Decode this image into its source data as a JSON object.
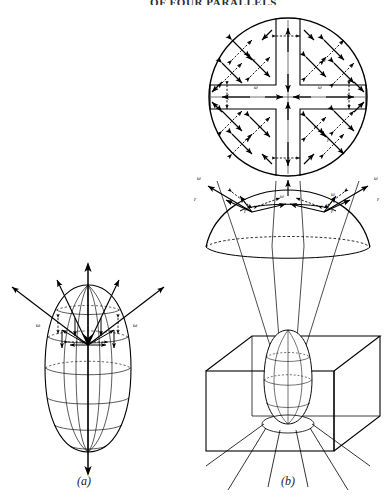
{
  "figure": {
    "domain": "scientific-illustration",
    "header_fragment": "OF FOUR PARALLELS",
    "background_color": "#ffffff",
    "ink_color": "#000000",
    "panels": [
      {
        "id": "a",
        "caption": "(a)",
        "description": "Ovoid (egg-shaped) body with meridian and parallel grid lines, a vertical axis arrow through the poles, and arrows radiating outward from the upper region.",
        "labels": [
          "ω",
          "ω"
        ]
      },
      {
        "id": "b",
        "caption": "(b)",
        "description": "Three-level construction: top-down circular disk with cross-shaped inner region and radiating arrow pairs; mid-level dome with arrows; lower 3D box containing a small ovoid with projection rays.",
        "labels": [
          "ω",
          "ε"
        ]
      }
    ],
    "symbols": {
      "omega": "ω",
      "epsilon": "ε"
    },
    "disk_labels": [
      {
        "symbol": "ε",
        "x": 253,
        "y": 62
      },
      {
        "symbol": "ε",
        "x": 324,
        "y": 62
      },
      {
        "symbol": "ω",
        "x": 254,
        "y": 89
      },
      {
        "symbol": "ω",
        "x": 321,
        "y": 89
      },
      {
        "symbol": "ω",
        "x": 258,
        "y": 127
      },
      {
        "symbol": "ω",
        "x": 316,
        "y": 127
      },
      {
        "symbol": "ε",
        "x": 249,
        "y": 141
      },
      {
        "symbol": "ε",
        "x": 327,
        "y": 141
      }
    ],
    "dome_labels": [
      {
        "symbol": "ω",
        "x": 199,
        "y": 177
      },
      {
        "symbol": "ε",
        "x": 196,
        "y": 198
      },
      {
        "symbol": "ω",
        "x": 378,
        "y": 177
      },
      {
        "symbol": "ε",
        "x": 379,
        "y": 198
      },
      {
        "symbol": "ω",
        "x": 283,
        "y": 196
      },
      {
        "symbol": "ω",
        "x": 334,
        "y": 195
      },
      {
        "symbol": "ε",
        "x": 246,
        "y": 211
      },
      {
        "symbol": "ε",
        "x": 333,
        "y": 211
      }
    ],
    "panel_a_labels": [
      {
        "symbol": "ω",
        "x": 39,
        "y": 324
      },
      {
        "symbol": "ω",
        "x": 136,
        "y": 324
      }
    ]
  }
}
